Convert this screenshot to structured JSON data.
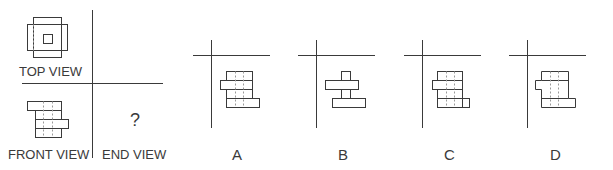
{
  "problem": {
    "views": {
      "top_view_label": "TOP VIEW",
      "front_view_label": "FRONT VIEW",
      "end_view_label": "END VIEW",
      "unknown_marker": "?"
    },
    "options": [
      {
        "label": "A"
      },
      {
        "label": "B"
      },
      {
        "label": "C"
      },
      {
        "label": "D"
      }
    ]
  },
  "colors": {
    "stroke": "#3a3a3a",
    "hidden_line": "#9a9a9a",
    "background": "#ffffff"
  }
}
